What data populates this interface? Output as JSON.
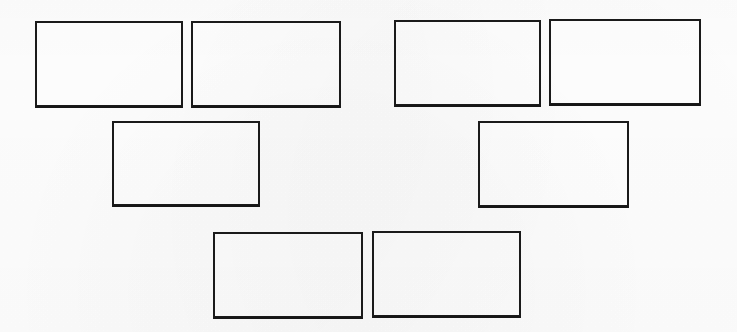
{
  "document": {
    "title": "Blank Boxes Diagram",
    "description": "Scanned worksheet containing eight empty rectangular boxes arranged in three rows",
    "background_color": "#fefefe",
    "box_fill_color": "#ffffff",
    "box_border_color": "#1a1a1a",
    "canvas": {
      "width": 737,
      "height": 332
    }
  },
  "rows": [
    {
      "name": "top-row",
      "box_count": 4
    },
    {
      "name": "middle-row",
      "box_count": 2
    },
    {
      "name": "bottom-row",
      "box_count": 2
    }
  ],
  "boxes": [
    {
      "id": "box-1",
      "label": "",
      "row": "top-row",
      "position": 1,
      "x": 35,
      "y": 21,
      "width": 148,
      "height": 87
    },
    {
      "id": "box-2",
      "label": "",
      "row": "top-row",
      "position": 2,
      "x": 191,
      "y": 21,
      "width": 150,
      "height": 87
    },
    {
      "id": "box-3",
      "label": "",
      "row": "top-row",
      "position": 3,
      "x": 394,
      "y": 20,
      "width": 147,
      "height": 87
    },
    {
      "id": "box-4",
      "label": "",
      "row": "top-row",
      "position": 4,
      "x": 549,
      "y": 19,
      "width": 152,
      "height": 87
    },
    {
      "id": "box-5",
      "label": "",
      "row": "middle-row",
      "position": 1,
      "x": 112,
      "y": 121,
      "width": 148,
      "height": 86
    },
    {
      "id": "box-6",
      "label": "",
      "row": "middle-row",
      "position": 2,
      "x": 478,
      "y": 121,
      "width": 151,
      "height": 87
    },
    {
      "id": "box-7",
      "label": "",
      "row": "bottom-row",
      "position": 1,
      "x": 213,
      "y": 232,
      "width": 150,
      "height": 87
    },
    {
      "id": "box-8",
      "label": "",
      "row": "bottom-row",
      "position": 2,
      "x": 372,
      "y": 231,
      "width": 149,
      "height": 87
    }
  ]
}
